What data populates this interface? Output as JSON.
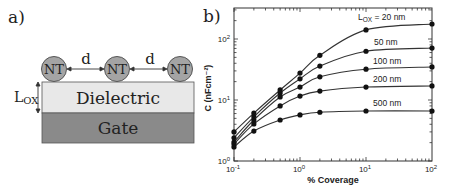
{
  "panel_a": {
    "label": "a)",
    "nanotube_label": "NT",
    "spacing_label": "d",
    "thickness_label_main": "L",
    "thickness_label_sub": "OX",
    "dielectric_label": "Dielectric",
    "gate_label": "Gate",
    "colors": {
      "nanotube_fill": "#a4a4a4",
      "nanotube_stroke": "#555555",
      "dielectric_fill": "#e8e8e8",
      "gate_fill": "#8a8a8a",
      "stroke": "#555555",
      "text": "#222222"
    }
  },
  "panel_b": {
    "label": "b)"
  },
  "chart_data": {
    "type": "line",
    "title": "",
    "xlabel": "% Coverage",
    "ylabel": "C (nFcm⁻²)",
    "xscale": "log",
    "yscale": "log",
    "xlim": [
      0.1,
      100
    ],
    "ylim": [
      1,
      300
    ],
    "grid": false,
    "legend_position": "inline-right",
    "x_tick_labels": [
      {
        "base": "10",
        "exp": "-1",
        "value": 0.1
      },
      {
        "base": "10",
        "exp": "0",
        "value": 1
      },
      {
        "base": "10",
        "exp": "1",
        "value": 10
      },
      {
        "base": "10",
        "exp": "2",
        "value": 100
      }
    ],
    "y_tick_labels": [
      {
        "base": "10",
        "exp": "0",
        "value": 1
      },
      {
        "base": "10",
        "exp": "1",
        "value": 10
      },
      {
        "base": "10",
        "exp": "2",
        "value": 100
      }
    ],
    "x": [
      0.1,
      0.2,
      0.5,
      1,
      2,
      10,
      100
    ],
    "series": [
      {
        "name": "LOX = 20 nm",
        "label_main": "L",
        "label_sub": "OX",
        "label_rest": " = 20 nm",
        "values": [
          3.0,
          6.1,
          14.6,
          27.6,
          54,
          141,
          176
        ]
      },
      {
        "name": "50 nm",
        "label_main": "50 nm",
        "values": [
          2.4,
          5.3,
          13.0,
          22.2,
          36,
          63,
          71
        ]
      },
      {
        "name": "100 nm",
        "label_main": "100 nm",
        "values": [
          2.05,
          4.7,
          11.2,
          16.3,
          24,
          32,
          34.8
        ]
      },
      {
        "name": "200 nm",
        "label_main": "200 nm",
        "values": [
          1.9,
          4.05,
          8.0,
          11.6,
          14,
          16.3,
          17
        ]
      },
      {
        "name": "500 nm",
        "label_main": "500 nm",
        "values": [
          1.7,
          3.1,
          4.7,
          5.7,
          6.3,
          6.6,
          6.6
        ]
      }
    ],
    "label_positions": [
      {
        "x": 358,
        "y": 20
      },
      {
        "x": 374,
        "y": 45
      },
      {
        "x": 373,
        "y": 64
      },
      {
        "x": 373,
        "y": 82
      },
      {
        "x": 373,
        "y": 106
      }
    ],
    "colors": {
      "line": "#333333",
      "marker": "#111111",
      "axis": "#333333",
      "text": "#222222"
    }
  }
}
